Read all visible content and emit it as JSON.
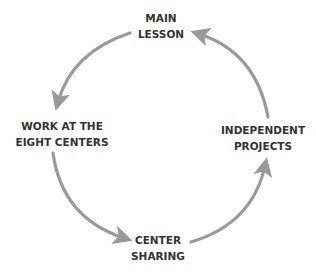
{
  "diagram": {
    "type": "cycle",
    "colors": {
      "text": "#333333",
      "arrow": "#9a9a9a",
      "background": "#ffffff"
    },
    "nodes": [
      {
        "id": "main-lesson",
        "lines": [
          "MAIN",
          "LESSON"
        ]
      },
      {
        "id": "work-at-centers",
        "lines": [
          "WORK AT THE",
          "EIGHT CENTERS"
        ]
      },
      {
        "id": "center-sharing",
        "lines": [
          "CENTER",
          "SHARING"
        ]
      },
      {
        "id": "independent-projects",
        "lines": [
          "INDEPENDENT",
          "PROJECTS"
        ]
      }
    ],
    "edges": [
      {
        "from": "main-lesson",
        "to": "work-at-centers"
      },
      {
        "from": "work-at-centers",
        "to": "center-sharing"
      },
      {
        "from": "center-sharing",
        "to": "independent-projects"
      },
      {
        "from": "independent-projects",
        "to": "main-lesson"
      }
    ]
  }
}
